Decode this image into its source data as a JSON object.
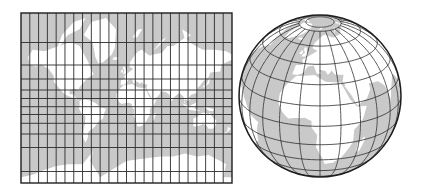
{
  "figure": {
    "caption": "World map in Mercator projection (left) and orthographic globe (right) with 15-degree graticule",
    "colors": {
      "background": "#ffffff",
      "ocean": "#c9c9c9",
      "land": "#ffffff",
      "grid": "#2b2b2b",
      "outline": "#1e1e1e"
    }
  },
  "mercator_map": {
    "label": "Mercator projection",
    "box": {
      "x": 21,
      "y": 13,
      "width": 211,
      "height": 170
    },
    "meridian_count": 24,
    "meridian_spacing_deg": 15,
    "parallel_lines_y": [
      42.5,
      65,
      79,
      90,
      98.5,
      106.7,
      114.5,
      123.3,
      134,
      147.5,
      171.5
    ]
  },
  "globe": {
    "label": "Orthographic globe",
    "center": {
      "x": 320,
      "y": 96
    },
    "radius": 81,
    "view_center": {
      "lat": 22,
      "lon": 15
    },
    "graticule_spacing_deg": 15
  }
}
